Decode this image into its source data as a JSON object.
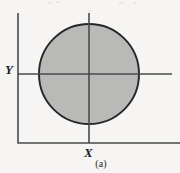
{
  "figure": {
    "caption": "(a)",
    "background_color": "#f6f5f3",
    "ink_color": "#3a3a3a",
    "axis_labels": {
      "x": "X",
      "y": "Y"
    },
    "frame": {
      "left_x": 18,
      "top_y": 13,
      "bottom_y": 143,
      "right_x": 180,
      "stroke_color": "#4a4a4a",
      "stroke_width": 1.6
    }
  },
  "chart_data": {
    "type": "scatter",
    "title": "",
    "subtitle": "",
    "xlabel": "X",
    "ylabel": "Y",
    "grid": false,
    "legend": null,
    "axes": {
      "origin_px": [
        89,
        74
      ],
      "x_axis": {
        "y_px": 74,
        "from_px": 18,
        "to_px": 172,
        "stroke_color": "#4a4a4a",
        "stroke_width": 1.6
      },
      "y_axis": {
        "x_px": 89,
        "from_px": 13,
        "to_px": 143,
        "stroke_color": "#4a4a4a",
        "stroke_width": 1.6
      }
    },
    "shapes": [
      {
        "kind": "circle",
        "name": "shaded-region",
        "center_px": [
          89,
          74
        ],
        "radius_px": 50,
        "fill": "#b9b9b7",
        "stroke": "#262626",
        "stroke_width": 1.9,
        "description": "Shaded circular region centered on the origin of the X-Y axes"
      }
    ],
    "annotations": [
      {
        "text": "X",
        "position_px": [
          88,
          152
        ],
        "style": "italic-serif"
      },
      {
        "text": "Y",
        "position_px": [
          9,
          70
        ],
        "style": "italic-serif"
      },
      {
        "text": "(a)",
        "position_px": [
          100,
          164
        ],
        "style": "roman-serif"
      }
    ]
  },
  "scan_artifacts": [
    {
      "x": 47,
      "y": 2,
      "w": 5,
      "h": 2
    },
    {
      "x": 56,
      "y": 1,
      "w": 3,
      "h": 2
    },
    {
      "x": 118,
      "y": 2,
      "w": 6,
      "h": 2
    },
    {
      "x": 133,
      "y": 2,
      "w": 4,
      "h": 2
    },
    {
      "x": 88,
      "y": 10,
      "w": 3,
      "h": 2
    }
  ]
}
